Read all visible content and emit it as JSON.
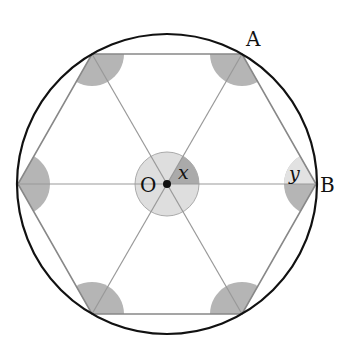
{
  "figure": {
    "labels": {
      "center": "O",
      "vertex_A": "A",
      "vertex_B": "B",
      "center_angle": "x",
      "vertex_angle": "y"
    },
    "colors": {
      "circle": "#111111",
      "hexagon": "#888888",
      "spokes": "#999999",
      "shade_dark": "#b0b0b0",
      "shade_light": "#dcdcdc"
    }
  }
}
